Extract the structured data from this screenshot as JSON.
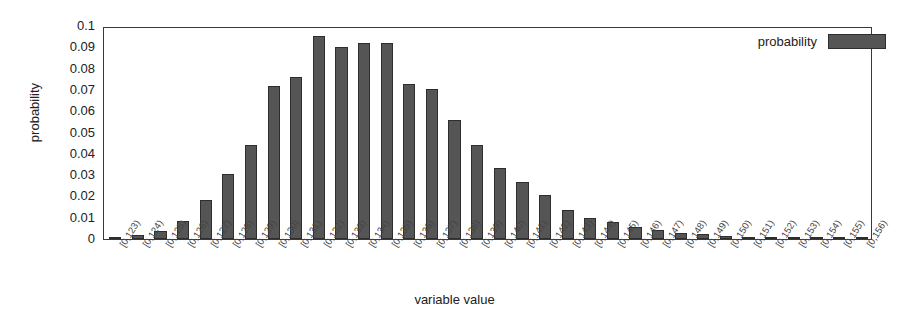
{
  "chart_data": {
    "type": "bar",
    "title": "",
    "xlabel": "variable value",
    "ylabel": "probability",
    "ylim": [
      0,
      0.1
    ],
    "grid": false,
    "legend": {
      "position": "top-right",
      "entries": [
        {
          "label": "probability",
          "color": "#555555"
        }
      ]
    },
    "yticks": [
      0,
      0.01,
      0.02,
      0.03,
      0.04,
      0.05,
      0.06,
      0.07,
      0.08,
      0.09,
      0.1
    ],
    "ytick_labels": [
      "0",
      "0.01",
      "0.02",
      "0.03",
      "0.04",
      "0.05",
      "0.06",
      "0.07",
      "0.08",
      "0.09",
      "0.1"
    ],
    "categories": [
      "[0,123)",
      "[0,124)",
      "[0,125)",
      "[0,126)",
      "[0,127)",
      "[0,128)",
      "[0,129)",
      "[0,130)",
      "[0,131)",
      "[0,132)",
      "[0,133)",
      "[0,134)",
      "[0,135)",
      "[0,136)",
      "[0,137)",
      "[0,138)",
      "[0,139)",
      "[0,140)",
      "[0,141)",
      "[0,142)",
      "[0,143)",
      "[0,144)",
      "[0,145)",
      "[0,146)",
      "[0,147)",
      "[0,148)",
      "[0,149)",
      "[0,150)",
      "[0,151)",
      "[0,152)",
      "[0,153)",
      "[0,154)",
      "[0,155)",
      "[0,156)"
    ],
    "values": [
      0.0005,
      0.0018,
      0.0038,
      0.0085,
      0.0185,
      0.0303,
      0.0443,
      0.0718,
      0.076,
      0.0955,
      0.09,
      0.092,
      0.0918,
      0.073,
      0.0705,
      0.056,
      0.0443,
      0.0335,
      0.0268,
      0.0205,
      0.0135,
      0.0098,
      0.008,
      0.0057,
      0.0042,
      0.003,
      0.0022,
      0.0013,
      0.0009,
      0.0007,
      0.0005,
      0.0003,
      0.0002,
      0.0002
    ],
    "colors": {
      "bar": "#555555",
      "bar_edge": "#2e2e2e",
      "axis": "#3a3a3a",
      "text": "#222222",
      "background": "#ffffff"
    }
  }
}
